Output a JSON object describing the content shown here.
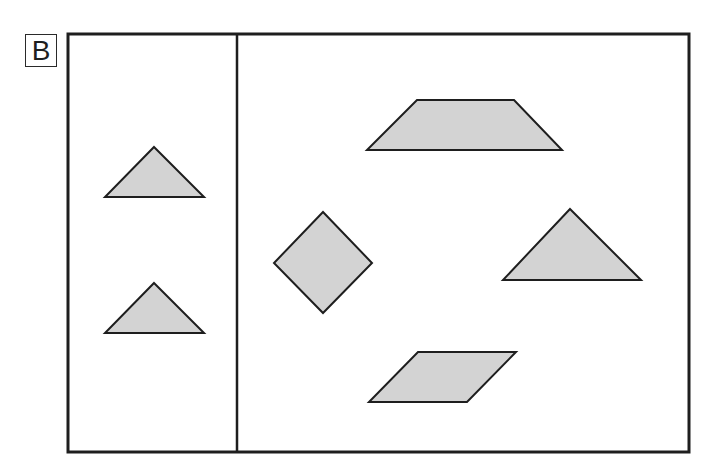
{
  "label": {
    "text": "B"
  },
  "frame": {
    "x": 68,
    "y": 34,
    "width": 621,
    "height": 418,
    "divider_x": 237,
    "stroke_color": "#1e1e1e"
  },
  "fill_color": "#d3d3d3",
  "panels": {
    "left": {
      "shapes": [
        {
          "name": "triangle-upper",
          "type": "triangle",
          "points": "154,147 204,197 105,197"
        },
        {
          "name": "triangle-lower",
          "type": "triangle",
          "points": "154,283 204,333 105,333"
        }
      ]
    },
    "right": {
      "shapes": [
        {
          "name": "trapezoid",
          "type": "trapezoid",
          "points": "417,100 514,100 562,150 367,150"
        },
        {
          "name": "diamond",
          "type": "square-rotated",
          "points": "323,212 372,263 323,313 274,263"
        },
        {
          "name": "triangle-large",
          "type": "triangle",
          "points": "570,209 641,280 503,280"
        },
        {
          "name": "parallelogram",
          "type": "parallelogram",
          "points": "418,352 516,352 467,402 369,402"
        }
      ]
    }
  }
}
